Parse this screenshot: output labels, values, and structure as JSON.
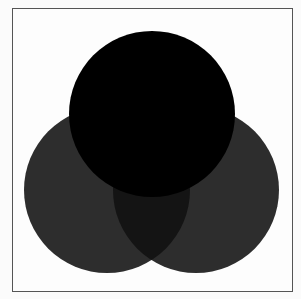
{
  "diagram": {
    "type": "venn",
    "sets": [
      {
        "name": "top-circle",
        "cx": 152,
        "cy": 114,
        "r": 83,
        "color": "#000000"
      },
      {
        "name": "left-circle",
        "cx": 107,
        "cy": 190,
        "r": 83,
        "color": "#2d2d2d"
      },
      {
        "name": "right-circle",
        "cx": 196,
        "cy": 190,
        "r": 83,
        "color": "#2d2d2d"
      }
    ],
    "overlap_left_right_color": "#141414",
    "frame_color": "#555555",
    "background": "#fdfdfd"
  }
}
